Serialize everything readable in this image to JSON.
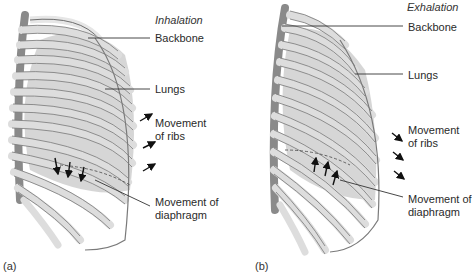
{
  "panels": [
    {
      "id": "a",
      "title": "Inhalation",
      "panel_label": "(a)",
      "labels": {
        "backbone": "Backbone",
        "lungs": "Lungs",
        "ribs_line1": "Movement",
        "ribs_line2": "of ribs",
        "diaphragm_line1": "Movement of",
        "diaphragm_line2": "diaphragm"
      },
      "rib_arrow_direction": "outward-up",
      "diaphragm_arrow_direction": "down"
    },
    {
      "id": "b",
      "title": "Exhalation",
      "panel_label": "(b)",
      "labels": {
        "backbone": "Backbone",
        "lungs": "Lungs",
        "ribs_line1": "Movement",
        "ribs_line2": "of ribs",
        "diaphragm_line1": "Movement of",
        "diaphragm_line2": "diaphragm"
      },
      "rib_arrow_direction": "inward-down",
      "diaphragm_arrow_direction": "up"
    }
  ],
  "colors": {
    "bone_fill": "#e8e8e8",
    "bone_stroke": "#6e6e6e",
    "lung_fill": "#bdbdbd",
    "arrow": "#111111",
    "leader_line": "#333333"
  }
}
